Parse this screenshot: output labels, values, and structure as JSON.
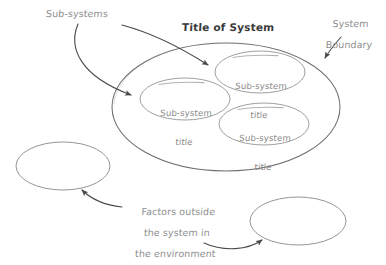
{
  "diagram": {
    "title": "Title of System",
    "colors": {
      "stroke_main": "#6e6e6e",
      "stroke_node": "#9a9a9a",
      "stroke_arrow": "#4a4a4a",
      "text_gray": "#8c8c8c",
      "text_title": "#3a3a3a",
      "background": "#ffffff"
    },
    "annotations": {
      "subsystems_label": "Sub-systems",
      "boundary_label_line1": "System",
      "boundary_label_line2": "Boundary",
      "factors_label_line1": "Factors outside",
      "factors_label_line2": "the system in",
      "factors_label_line3": "the environment"
    },
    "system_boundary": {
      "name": "system-boundary-ellipse",
      "cx": 226,
      "cy": 107,
      "rx": 114,
      "ry": 64
    },
    "subsystems": [
      {
        "id": "subsystem-top",
        "line1": "Sub-system",
        "line2": "title",
        "cx": 260,
        "cy": 72,
        "rx": 45,
        "ry": 21
      },
      {
        "id": "subsystem-left",
        "line1": "Sub-system",
        "line2": "title",
        "cx": 185,
        "cy": 99,
        "rx": 45,
        "ry": 21
      },
      {
        "id": "subsystem-bottom",
        "line1": "Sub-system",
        "line2": "title",
        "cx": 264,
        "cy": 124,
        "rx": 45,
        "ry": 21
      }
    ],
    "external_factors": [
      {
        "id": "external-ellipse-left",
        "cx": 63,
        "cy": 166,
        "rx": 47,
        "ry": 24
      },
      {
        "id": "external-ellipse-right",
        "cx": 298,
        "cy": 221,
        "rx": 48,
        "ry": 24
      }
    ]
  }
}
